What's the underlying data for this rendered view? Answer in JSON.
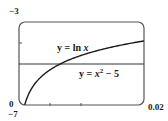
{
  "chart_data": {
    "type": "line",
    "title": "",
    "xlabel": "",
    "ylabel": "",
    "xlim": [
      0,
      0.02
    ],
    "ylim": [
      -7,
      -3
    ],
    "grid": false,
    "legend_position": "none",
    "tick_labels": {
      "x_min": "0",
      "x_max": "0.02",
      "y_min": "-7",
      "y_max": "-3"
    },
    "x_ticks": [
      0.005,
      0.01
    ],
    "y_ticks": [
      -4
    ],
    "series": [
      {
        "name": "y = ln x",
        "label_text": "y = ln x",
        "function": "ln(x)",
        "x": [
          0.001,
          0.002,
          0.004,
          0.006,
          0.008,
          0.01,
          0.012,
          0.014,
          0.016,
          0.018,
          0.02
        ],
        "values": [
          -6.91,
          -6.21,
          -5.52,
          -5.12,
          -4.83,
          -4.61,
          -4.42,
          -4.27,
          -4.14,
          -4.02,
          -3.91
        ]
      },
      {
        "name": "y = x^2 - 5",
        "label_text": "y = x² − 5",
        "function": "x^2 - 5",
        "x": [
          0,
          0.005,
          0.01,
          0.015,
          0.02
        ],
        "values": [
          -5.0,
          -5.0,
          -5.0,
          -5.0,
          -5.0
        ]
      }
    ],
    "annotations": [
      "y = ln x",
      "y = x² − 5"
    ]
  },
  "labels": {
    "y_top": "−3",
    "y_bottom": "−7",
    "x_left": "0",
    "x_right": "0.02",
    "eq1_prefix": "y = ln ",
    "eq1_var": "x",
    "eq2_prefix": "y = ",
    "eq2_var": "x",
    "eq2_exp": "2",
    "eq2_suffix": " − 5"
  },
  "colors": {
    "axis": "#555555",
    "curve": "#1a1a1a",
    "line": "#333333"
  }
}
